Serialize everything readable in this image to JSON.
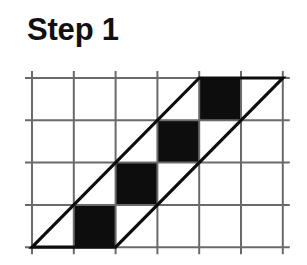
{
  "page": {
    "background_color": "#ffffff",
    "width": 307,
    "height": 265
  },
  "title": {
    "text": "Step 1",
    "color": "#111111"
  },
  "figure": {
    "label": "staircase-in-parallelogram",
    "colors": {
      "grid_line": "#6a6a6a",
      "shape_outline": "#0d0d0d",
      "filled_cell": "#0d0d0d",
      "empty_cell": "#ffffff"
    },
    "grid": {
      "columns": 6,
      "rows": 4,
      "origin_x": 32,
      "origin_y": 78,
      "cell_width": 41.8,
      "cell_height": 42.3,
      "overhang": 7,
      "line_width": 2,
      "x_positions": [
        32,
        73.8,
        115.6,
        157.4,
        199.2,
        241,
        282.8
      ],
      "y_positions": [
        78,
        120.3,
        162.6,
        204.9,
        247.2
      ]
    },
    "parallelogram": {
      "line_width": 3.2,
      "vertices": [
        [
          32,
          247.2
        ],
        [
          199.2,
          78
        ],
        [
          282.8,
          78
        ],
        [
          115.6,
          247.2
        ]
      ],
      "point_labels": [
        "bottom-left",
        "top-left",
        "top-right",
        "bottom-right"
      ]
    },
    "filled_cells": [
      {
        "col": 4,
        "row": 0
      },
      {
        "col": 3,
        "row": 1
      },
      {
        "col": 2,
        "row": 2
      },
      {
        "col": 1,
        "row": 3
      }
    ],
    "filled_cell_count": 4
  }
}
